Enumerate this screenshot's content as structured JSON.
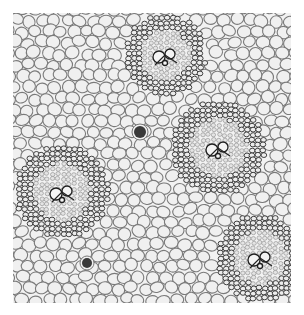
{
  "image": {
    "subject": "monocot stem cross-section micrograph",
    "frame": {
      "x": 13,
      "y": 13,
      "width": 278,
      "height": 290
    },
    "background": "#ffffff",
    "tissue_bg": "#f2f2f2",
    "cell_wall_color": "#7a7a7a",
    "cell_fill": "#f0f0f0",
    "bundle_wall_color": "#2e2e2e",
    "vascular_bundles": [
      {
        "cx": 165,
        "cy": 55,
        "r": 42
      },
      {
        "cx": 218,
        "cy": 148,
        "r": 48
      },
      {
        "cx": 62,
        "cy": 192,
        "r": 48
      },
      {
        "cx": 260,
        "cy": 258,
        "r": 45
      }
    ],
    "dark_cells": [
      {
        "cx": 140,
        "cy": 132,
        "r": 6
      },
      {
        "cx": 87,
        "cy": 263,
        "r": 5
      }
    ]
  }
}
